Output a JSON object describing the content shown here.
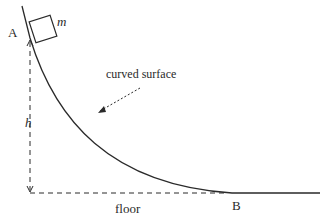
{
  "diagram": {
    "type": "physics-diagram",
    "labels": {
      "point_a": "A",
      "point_b": "B",
      "mass": "m",
      "height": "h",
      "surface": "curved surface",
      "floor": "floor"
    },
    "colors": {
      "line": "#2a2a2a",
      "background": "#ffffff"
    }
  }
}
